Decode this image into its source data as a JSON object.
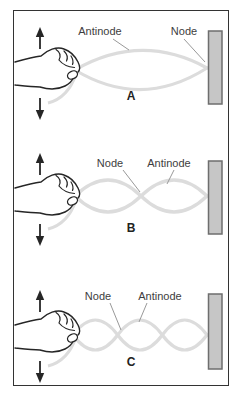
{
  "figure": {
    "panels": [
      {
        "letter": "A",
        "harmonic_segments": 1,
        "labels": {
          "antinode": "Antinode",
          "node": "Node"
        }
      },
      {
        "letter": "B",
        "harmonic_segments": 2,
        "labels": {
          "node": "Node",
          "antinode": "Antinode"
        }
      },
      {
        "letter": "C",
        "harmonic_segments": 3,
        "labels": {
          "node": "Node",
          "antinode": "Antinode"
        }
      }
    ],
    "colors": {
      "string": "#dcdcdc",
      "wall_fill": "#c6c6c6",
      "wall_border": "#6e6e6e",
      "ink": "#262626",
      "hand_fill": "#ffffff",
      "label_text": "#3d3d3d",
      "leader_line": "#999999",
      "frame_border": "#333333",
      "background": "#ffffff"
    }
  }
}
